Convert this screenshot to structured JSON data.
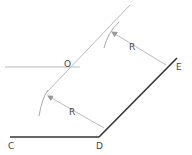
{
  "diagram": {
    "labels": {
      "C": "C",
      "D": "D",
      "E": "E",
      "O": "O",
      "R_upper": "R",
      "R_lower": "R"
    },
    "colors": {
      "main_line": "#333333",
      "construction_line": "#b8b8b8",
      "label": "#444444"
    }
  }
}
